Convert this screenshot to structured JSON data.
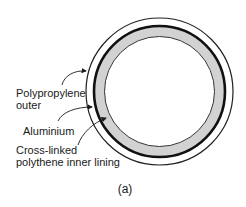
{
  "figure": {
    "caption": "(a)",
    "colors": {
      "outer_line": "#222222",
      "aluminium": "#111111",
      "inner_fill": "#d2d2d2",
      "background": "#ffffff"
    },
    "labels": [
      {
        "id": "polypropylene",
        "lines": [
          "Polypropylene",
          "outer"
        ]
      },
      {
        "id": "aluminium",
        "lines": [
          "Aluminium"
        ]
      },
      {
        "id": "pex",
        "lines": [
          "Cross-linked",
          "polythene inner lining"
        ]
      }
    ]
  }
}
